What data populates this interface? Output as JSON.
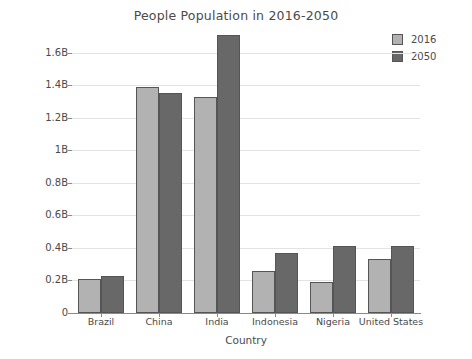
{
  "chart_data": {
    "type": "bar",
    "title": "People Population in 2016-2050",
    "xlabel": "Country",
    "ylabel": "People Growth (Millions)",
    "categories": [
      "Brazil",
      "China",
      "India",
      "Indonesia",
      "Nigeria",
      "United States"
    ],
    "series": [
      {
        "name": "2016",
        "color": "#b2b2b2",
        "values": [
          0.21,
          1.39,
          1.33,
          0.26,
          0.19,
          0.33
        ]
      },
      {
        "name": "2050",
        "color": "#686868",
        "values": [
          0.23,
          1.35,
          1.71,
          0.37,
          0.41,
          0.41
        ]
      }
    ],
    "yticks": [
      {
        "value": 0,
        "label": "0"
      },
      {
        "value": 0.2,
        "label": "0.2B"
      },
      {
        "value": 0.4,
        "label": "0.4B"
      },
      {
        "value": 0.6,
        "label": "0.6B"
      },
      {
        "value": 0.8,
        "label": "0.8B"
      },
      {
        "value": 1.0,
        "label": "1B"
      },
      {
        "value": 1.2,
        "label": "1.2B"
      },
      {
        "value": 1.4,
        "label": "1.4B"
      },
      {
        "value": 1.6,
        "label": "1.6B"
      }
    ],
    "ylim": [
      0,
      1.8
    ],
    "units": "billions",
    "grid": true,
    "legend_position": "top-right"
  }
}
